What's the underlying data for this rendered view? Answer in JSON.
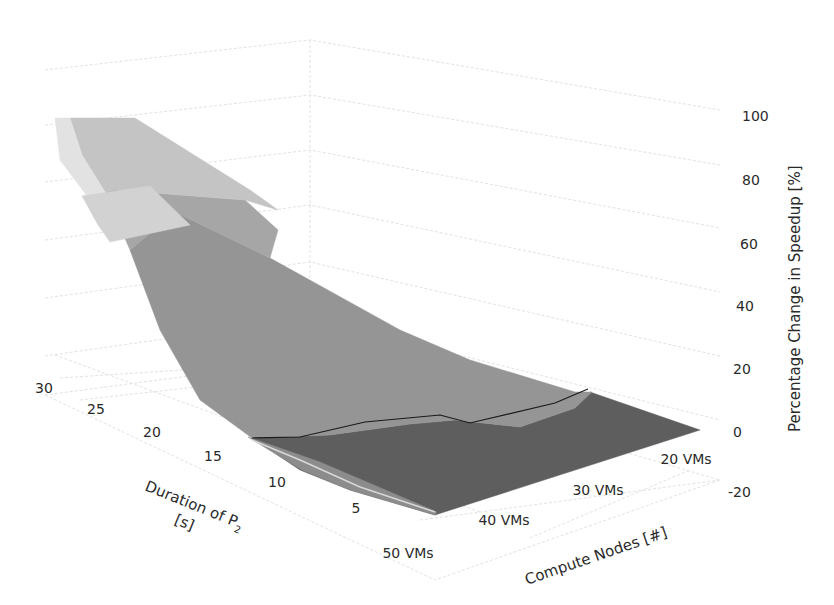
{
  "chart_data": {
    "type": "surface3d",
    "title": "",
    "x_axis": {
      "label": "Compute Nodes [#]",
      "categories": [
        "20 VMs",
        "30 VMs",
        "40 VMs",
        "50 VMs"
      ]
    },
    "y_axis": {
      "label_line1": "Duration of P",
      "label_sub": "2",
      "label_line2": "[s]",
      "ticks": [
        5,
        10,
        15,
        20,
        25,
        30
      ]
    },
    "z_axis": {
      "label": "Percentage Change in Speedup [%]",
      "ticks": [
        100,
        80,
        60,
        40,
        20,
        0,
        -20
      ],
      "range": [
        -20,
        100
      ]
    },
    "series": [
      {
        "vms": "20 VMs",
        "duration": [
          5,
          10,
          15,
          20,
          25,
          30
        ],
        "values": [
          0,
          2,
          8,
          18,
          32,
          50
        ]
      },
      {
        "vms": "30 VMs",
        "duration": [
          5,
          10,
          15,
          20,
          25,
          30
        ],
        "values": [
          0,
          4,
          14,
          30,
          52,
          75
        ]
      },
      {
        "vms": "40 VMs",
        "duration": [
          5,
          10,
          15,
          20,
          25,
          30
        ],
        "values": [
          -2,
          3,
          16,
          36,
          62,
          92
        ]
      },
      {
        "vms": "50 VMs",
        "duration": [
          5,
          10,
          15,
          20,
          25,
          30
        ],
        "values": [
          -5,
          -2,
          10,
          35,
          68,
          100
        ]
      }
    ],
    "bands": [
      {
        "range": "-20-0",
        "color": "#5e5e5e"
      },
      {
        "range": "0-20",
        "color": "#8a8a8a"
      },
      {
        "range": "20-40",
        "color": "#9b9b9b"
      },
      {
        "range": "40-60",
        "color": "#b3b3b3"
      },
      {
        "range": "60-80",
        "color": "#cdcdcd"
      },
      {
        "range": "80-100",
        "color": "#e6e6e6"
      }
    ],
    "legend": "none",
    "grid": true
  },
  "surface_polys": [
    {
      "band": "dark",
      "color": "#5e5e5e",
      "points": "252,438 330,435 410,424 455,420 520,427 575,408 590,392 700,430 435,515 350,490 300,470"
    },
    {
      "band": "mid",
      "color": "#8c8c8c",
      "points": "248,437 302,470 350,490 435,515 437,512 320,462"
    },
    {
      "band": "lower",
      "color": "#959595",
      "points": "130,250 175,212 270,258 400,330 470,360 575,392 592,392 575,408 520,427 455,420 410,424 330,435 252,438 200,400 160,330"
    },
    {
      "band": "mid2",
      "color": "#a6a6a6",
      "points": "105,192 115,190 245,200 278,230 270,258 175,212 130,250"
    },
    {
      "band": "upper",
      "color": "#c4c4c4",
      "points": "70,118 135,118 250,190 278,210 245,200 115,190 105,192 82,155"
    },
    {
      "band": "top",
      "color": "#e2e2e2",
      "points": "55,118 70,118 82,155 105,192 90,200 60,160"
    },
    {
      "band": "top2",
      "color": "#d2d2d2",
      "points": "82,196 150,186 190,225 110,242 98,225"
    }
  ],
  "contour_line": "252,438 300,437 365,422 440,415 470,423 555,403 588,389",
  "highlight_line": "252,440 300,460 360,487 435,512",
  "z_tick_positions": [
    {
      "label": "100",
      "x": 742,
      "y": 121
    },
    {
      "label": "80",
      "x": 742,
      "y": 185
    },
    {
      "label": "60",
      "x": 740,
      "y": 249
    },
    {
      "label": "40",
      "x": 736,
      "y": 311
    },
    {
      "label": "20",
      "x": 733,
      "y": 374
    },
    {
      "label": "0",
      "x": 733,
      "y": 437
    },
    {
      "label": "-20",
      "x": 728,
      "y": 497
    }
  ],
  "y_tick_positions": [
    {
      "label": "30",
      "x": 44,
      "y": 393
    },
    {
      "label": "25",
      "x": 96,
      "y": 414
    },
    {
      "label": "20",
      "x": 152,
      "y": 437
    },
    {
      "label": "15",
      "x": 213,
      "y": 461
    },
    {
      "label": "10",
      "x": 277,
      "y": 487
    },
    {
      "label": "5",
      "x": 356,
      "y": 513
    }
  ],
  "x_tick_positions": [
    {
      "label": "50 VMs",
      "x": 408,
      "y": 558
    },
    {
      "label": "40 VMs",
      "x": 504,
      "y": 525
    },
    {
      "label": "30 VMs",
      "x": 598,
      "y": 495
    },
    {
      "label": "20 VMs",
      "x": 686,
      "y": 464
    }
  ]
}
